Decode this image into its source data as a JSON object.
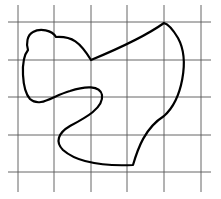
{
  "figure": {
    "grid": {
      "vertical_x": [
        18,
        54,
        91,
        127,
        164,
        201
      ],
      "horizontal_y": [
        22,
        60,
        97,
        135,
        172
      ],
      "x_extent": [
        8,
        211
      ],
      "y_extent": [
        5,
        192
      ],
      "line_color": "#555555"
    },
    "shape": {
      "stroke_color": "#000000",
      "path": "M 91 60 C 80 42, 72 36, 56 37 C 52 30, 40 28, 33 32 C 27 35, 26 44, 28 50 C 20 60, 22 90, 30 99 C 40 108, 52 96, 70 91 C 85 86, 100 85, 102 95 C 104 108, 85 118, 70 126 C 58 133, 55 142, 63 150 C 80 165, 110 166, 133 165 L 133 165 C 138 148, 145 128, 164 116 C 182 100, 190 60, 178 38 C 172 28, 168 24, 164 23 C 150 33, 120 48, 91 60 Z"
    }
  }
}
